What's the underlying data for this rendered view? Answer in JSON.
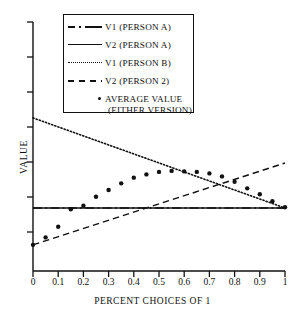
{
  "chart_data": {
    "type": "line",
    "title": "",
    "xlabel": "PERCENT CHOICES OF 1",
    "ylabel": "VALUE",
    "xlim": [
      0,
      1
    ],
    "ylim": [
      0,
      1
    ],
    "xticks": [
      0,
      0.1,
      0.2,
      0.3,
      0.4,
      0.5,
      0.6,
      0.7,
      0.8,
      0.9,
      1
    ],
    "xticklabels": [
      "0",
      "0.1",
      "0.2",
      "0.3",
      "0.4",
      "0.5",
      "0.6",
      "0.7",
      "0.8",
      "0.9",
      "1"
    ],
    "yticks": [
      0.1,
      0.24,
      0.38,
      0.52,
      0.66,
      0.8,
      0.94
    ],
    "yticklabels": [
      "",
      "",
      "",
      "",
      "",
      "",
      ""
    ],
    "grid": false,
    "legend_position": "upper center",
    "series": [
      {
        "name": "V1 (PERSON A)",
        "style": "dashdot",
        "color": "#111111",
        "x": [
          0,
          1
        ],
        "y": [
          0.253,
          0.253
        ]
      },
      {
        "name": "V2 (PERSON A)",
        "style": "solid",
        "color": "#111111",
        "x": [
          0,
          1
        ],
        "y": [
          0.253,
          0.253
        ]
      },
      {
        "name": "V1 (PERSON B)",
        "style": "dotted",
        "color": "#111111",
        "x": [
          0,
          1
        ],
        "y": [
          0.615,
          0.253
        ]
      },
      {
        "name": "V2 (PERSON 2)",
        "style": "dashed",
        "color": "#111111",
        "x": [
          0,
          1
        ],
        "y": [
          0.105,
          0.434
        ]
      },
      {
        "name": "AVERAGE VALUE (EITHER VERSION)",
        "style": "markers",
        "marker": "dot",
        "color": "#111111",
        "x": [
          0.0,
          0.05,
          0.1,
          0.15,
          0.2,
          0.25,
          0.3,
          0.35,
          0.4,
          0.45,
          0.5,
          0.55,
          0.6,
          0.65,
          0.7,
          0.75,
          0.8,
          0.85,
          0.9,
          0.95,
          1.0
        ],
        "y": [
          0.105,
          0.135,
          0.178,
          0.248,
          0.262,
          0.298,
          0.325,
          0.352,
          0.375,
          0.388,
          0.398,
          0.402,
          0.4,
          0.398,
          0.392,
          0.38,
          0.358,
          0.332,
          0.308,
          0.28,
          0.256
        ]
      }
    ]
  },
  "legend": {
    "entries": [
      {
        "label": "V1 (PERSON A)",
        "sample": "dashdot-line-sample"
      },
      {
        "label": "V2 (PERSON A)",
        "sample": "solid-line-sample"
      },
      {
        "label": "V1 (PERSON B)",
        "sample": "dotted-line-sample"
      },
      {
        "label": "V2 (PERSON 2)",
        "sample": "dashed-line-sample"
      },
      {
        "label": "AVERAGE VALUE",
        "label2": "(EITHER VERSION)",
        "sample": "dot-marker-sample"
      }
    ]
  },
  "axes": {
    "x_title": "PERCENT CHOICES OF 1",
    "y_title": "VALUE"
  }
}
